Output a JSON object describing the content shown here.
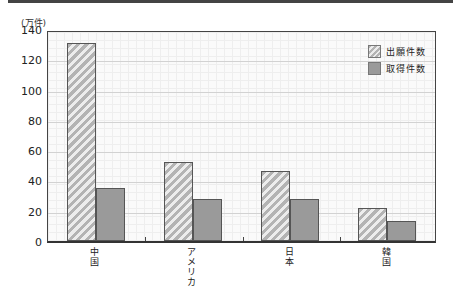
{
  "chart_data": {
    "type": "bar",
    "title": "",
    "unit_label": "(万件)",
    "xlabel": "",
    "ylabel": "(万件)",
    "ylim": [
      0,
      140
    ],
    "yticks": [
      0,
      20,
      40,
      60,
      80,
      100,
      120,
      140
    ],
    "categories": [
      "中国",
      "アメリカ",
      "日本",
      "韓国"
    ],
    "series": [
      {
        "name": "出願件数",
        "pattern": "hatched",
        "color": "#d0d0d0",
        "values": [
          131,
          52,
          46,
          22
        ]
      },
      {
        "name": "取得件数",
        "pattern": "solid",
        "color": "#9a9a9a",
        "values": [
          35,
          28,
          28,
          13
        ]
      }
    ],
    "grid": true,
    "legend_position": "top-right"
  },
  "labels": {
    "unit": "(万件)",
    "yticks": [
      "140",
      "120",
      "100",
      "80",
      "60",
      "40",
      "20",
      "0"
    ],
    "categories": [
      "中国",
      "アメリカ",
      "日本",
      "韓国"
    ],
    "legend": [
      "出願件数",
      "取得件数"
    ]
  }
}
